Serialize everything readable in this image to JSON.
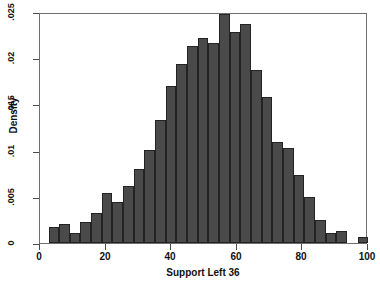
{
  "chart_data": {
    "type": "bar",
    "title": "",
    "xlabel": "Support Left 36",
    "ylabel": "Density",
    "xlim": [
      0,
      100
    ],
    "ylim": [
      0,
      0.025
    ],
    "grid": false,
    "legend": null,
    "bin_width": 3.25,
    "xticks": [
      "0",
      "20",
      "40",
      "60",
      "80",
      "100"
    ],
    "xtick_values": [
      0,
      20,
      40,
      60,
      80,
      100
    ],
    "yticks": [
      "0",
      ".005",
      ".01",
      ".015",
      ".02",
      ".025"
    ],
    "ytick_values": [
      0,
      0.005,
      0.01,
      0.015,
      0.02,
      0.025
    ],
    "bar_color": "#4a4a4a",
    "bar_edge_color": "#232323",
    "frame_color": "#6f6f6f",
    "bins": [
      {
        "x_start": 2.6,
        "x_end": 5.8,
        "center": 4.2,
        "value": 0.00175
      },
      {
        "x_start": 5.8,
        "x_end": 9.1,
        "center": 7.5,
        "value": 0.00205
      },
      {
        "x_start": 9.1,
        "x_end": 12.3,
        "center": 10.7,
        "value": 0.0011
      },
      {
        "x_start": 12.3,
        "x_end": 15.6,
        "center": 14.0,
        "value": 0.0023
      },
      {
        "x_start": 15.6,
        "x_end": 18.8,
        "center": 17.2,
        "value": 0.0032
      },
      {
        "x_start": 18.8,
        "x_end": 22.1,
        "center": 20.5,
        "value": 0.0054
      },
      {
        "x_start": 22.1,
        "x_end": 25.3,
        "center": 23.7,
        "value": 0.0044
      },
      {
        "x_start": 25.3,
        "x_end": 28.6,
        "center": 27.0,
        "value": 0.0062
      },
      {
        "x_start": 28.6,
        "x_end": 31.8,
        "center": 30.2,
        "value": 0.00805
      },
      {
        "x_start": 31.8,
        "x_end": 35.1,
        "center": 33.5,
        "value": 0.0101
      },
      {
        "x_start": 35.1,
        "x_end": 38.3,
        "center": 36.7,
        "value": 0.01335
      },
      {
        "x_start": 38.3,
        "x_end": 41.6,
        "center": 40.0,
        "value": 0.017
      },
      {
        "x_start": 41.6,
        "x_end": 44.8,
        "center": 43.2,
        "value": 0.0194
      },
      {
        "x_start": 44.8,
        "x_end": 48.1,
        "center": 46.5,
        "value": 0.02135
      },
      {
        "x_start": 48.1,
        "x_end": 51.3,
        "center": 49.7,
        "value": 0.02215
      },
      {
        "x_start": 51.3,
        "x_end": 54.6,
        "center": 53.0,
        "value": 0.0217
      },
      {
        "x_start": 54.6,
        "x_end": 57.8,
        "center": 56.2,
        "value": 0.0248
      },
      {
        "x_start": 57.8,
        "x_end": 61.1,
        "center": 59.5,
        "value": 0.0228
      },
      {
        "x_start": 61.1,
        "x_end": 64.3,
        "center": 62.7,
        "value": 0.02365
      },
      {
        "x_start": 64.3,
        "x_end": 67.6,
        "center": 66.0,
        "value": 0.0187
      },
      {
        "x_start": 67.6,
        "x_end": 70.8,
        "center": 69.2,
        "value": 0.0158
      },
      {
        "x_start": 70.8,
        "x_end": 74.1,
        "center": 72.5,
        "value": 0.0109
      },
      {
        "x_start": 74.1,
        "x_end": 77.3,
        "center": 75.7,
        "value": 0.0103
      },
      {
        "x_start": 77.3,
        "x_end": 80.6,
        "center": 79.0,
        "value": 0.00735
      },
      {
        "x_start": 80.6,
        "x_end": 83.8,
        "center": 82.2,
        "value": 0.00495
      },
      {
        "x_start": 83.8,
        "x_end": 87.1,
        "center": 85.5,
        "value": 0.0025
      },
      {
        "x_start": 87.1,
        "x_end": 90.3,
        "center": 88.7,
        "value": 0.00105
      },
      {
        "x_start": 90.3,
        "x_end": 93.6,
        "center": 92.0,
        "value": 0.0013
      },
      {
        "x_start": 96.8,
        "x_end": 100.0,
        "center": 98.4,
        "value": 0.00065
      }
    ]
  }
}
